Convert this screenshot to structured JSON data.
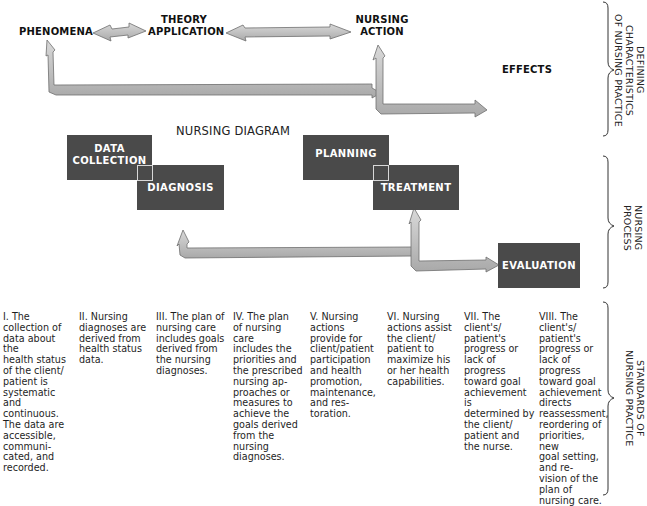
{
  "top_diagram": {
    "phenomena": "PHENOMENA",
    "theory_application": "THEORY\nAPPLICATION",
    "theory_line1": "THEORY",
    "theory_line2": "APPLICATION",
    "nursing_action_line1": "NURSING",
    "nursing_action_line2": "ACTION",
    "effects": "EFFECTS"
  },
  "nursing_diagram": {
    "title": "NURSING DIAGRAM",
    "boxes": {
      "data_collection_line1": "DATA",
      "data_collection_line2": "COLLECTION",
      "diagnosis": "DIAGNOSIS",
      "planning": "PLANNING",
      "treatment": "TREATMENT",
      "evaluation": "EVALUATION"
    }
  },
  "side_labels": {
    "defining": "DEFINING CHARACTERISTICS\nOF NURSING PRACTICE",
    "process": "NURSING\nPROCESS",
    "standards": "STANDARDS OF\nNURSING PRACTICE"
  },
  "standards": [
    {
      "numeral": "I.",
      "text": "I. The\ncollection of\ndata about the\nhealth status\nof the client/\npatient is\nsystematic and\ncontinuous.\nThe data are\naccessible,\ncommuni-\ncated, and\nrecorded."
    },
    {
      "numeral": "II.",
      "text": "II. Nursing\ndiagnoses are\nderived from\nhealth status\ndata."
    },
    {
      "numeral": "III.",
      "text": "III. The plan of\nnursing care\nincludes goals\nderived from\nthe nursing\ndiagnoses."
    },
    {
      "numeral": "IV.",
      "text": "IV. The plan\nof nursing care\nincludes the\npriorities and\nthe prescribed\nnursing ap-\nproaches or\nmeasures to\nachieve the\ngoals derived\nfrom the\nnursing\ndiagnoses."
    },
    {
      "numeral": "V.",
      "text": "V. Nursing\nactions\nprovide for\nclient/patient\nparticipation\nand health\npromotion,\nmaintenance,\nand res-\ntoration."
    },
    {
      "numeral": "VI.",
      "text": "VI. Nursing\nactions assist\nthe client/\npatient to\nmaximize his\nor her health\ncapabilities."
    },
    {
      "numeral": "VII.",
      "text": "VII. The\nclient's/\npatient's\nprogress or\nlack of\nprogress\ntoward goal\nachievement is\ndetermined by\nthe client/\npatient and\nthe nurse."
    },
    {
      "numeral": "VIII.",
      "text": "VIII. The\nclient's/\npatient's\nprogress or\nlack of\nprogress\ntoward goal\nachievement\ndirects\nreassessment,\nreordering of\npriorities, new\ngoal setting,\nand re-\nvision of the\nplan of\nnursing care."
    }
  ],
  "colors": {
    "box_fill": "#4a4a4a",
    "arrow_fill": "#c4c4c4",
    "arrow_edge": "#6e6e6e",
    "text": "#1a1a1a"
  }
}
